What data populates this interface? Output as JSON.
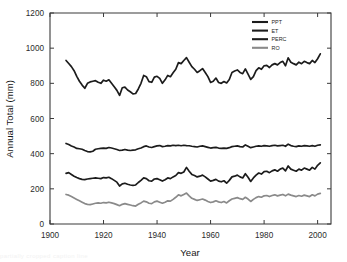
{
  "chart_data": {
    "type": "line",
    "title": "",
    "xlabel": "Year",
    "ylabel": "Annual Total (mm)",
    "xlim": [
      1900,
      2005
    ],
    "ylim": [
      0,
      1200
    ],
    "xticks": [
      1900,
      1920,
      1940,
      1960,
      1980,
      2000
    ],
    "xtick_labels": [
      "1900",
      "1920",
      "1940",
      "1960",
      "1980",
      "2000"
    ],
    "yticks": [
      0,
      200,
      400,
      600,
      800,
      1000,
      1200
    ],
    "ytick_labels": [
      "0",
      "200",
      "400",
      "600",
      "800",
      "1000",
      "1200"
    ],
    "grid": false,
    "legend_position": "top-right-inside",
    "x": [
      1906,
      1907,
      1908,
      1909,
      1910,
      1911,
      1912,
      1913,
      1914,
      1915,
      1916,
      1917,
      1918,
      1919,
      1920,
      1921,
      1922,
      1923,
      1924,
      1925,
      1926,
      1927,
      1928,
      1929,
      1930,
      1931,
      1932,
      1933,
      1934,
      1935,
      1936,
      1937,
      1938,
      1939,
      1940,
      1941,
      1942,
      1943,
      1944,
      1945,
      1946,
      1947,
      1948,
      1949,
      1950,
      1951,
      1952,
      1953,
      1954,
      1955,
      1956,
      1957,
      1958,
      1959,
      1960,
      1961,
      1962,
      1963,
      1964,
      1965,
      1966,
      1967,
      1968,
      1969,
      1970,
      1971,
      1972,
      1973,
      1974,
      1975,
      1976,
      1977,
      1978,
      1979,
      1980,
      1981,
      1982,
      1983,
      1984,
      1985,
      1986,
      1987,
      1988,
      1989,
      1990,
      1991,
      1992,
      1993,
      1994,
      1995,
      1996,
      1997,
      1998,
      1999,
      2000,
      2001
    ],
    "series": [
      {
        "name": "PPT",
        "color": "#1c1c1c",
        "width": 1.7,
        "values": [
          930,
          913,
          895,
          872,
          840,
          812,
          790,
          772,
          800,
          808,
          812,
          815,
          806,
          800,
          818,
          812,
          820,
          800,
          780,
          760,
          731,
          775,
          778,
          762,
          752,
          740,
          742,
          768,
          800,
          845,
          838,
          810,
          806,
          835,
          840,
          828,
          800,
          820,
          845,
          838,
          860,
          880,
          918,
          912,
          930,
          946,
          920,
          895,
          880,
          862,
          872,
          884,
          862,
          838,
          805,
          812,
          830,
          805,
          800,
          810,
          802,
          822,
          862,
          870,
          876,
          862,
          855,
          882,
          852,
          822,
          838,
          872,
          888,
          880,
          900,
          902,
          890,
          905,
          912,
          905,
          918,
          925,
          900,
          945,
          920,
          912,
          905,
          920,
          912,
          925,
          918,
          912,
          930,
          918,
          940,
          968
        ]
      },
      {
        "name": "ET",
        "color": "#1c1c1c",
        "width": 1.7,
        "values": [
          458,
          452,
          444,
          438,
          430,
          428,
          425,
          418,
          412,
          410,
          414,
          425,
          428,
          430,
          432,
          430,
          435,
          432,
          428,
          424,
          418,
          420,
          424,
          420,
          418,
          420,
          422,
          428,
          432,
          440,
          444,
          438,
          435,
          440,
          444,
          446,
          440,
          442,
          446,
          444,
          448,
          446,
          448,
          445,
          448,
          446,
          445,
          442,
          440,
          438,
          442,
          444,
          440,
          436,
          432,
          434,
          436,
          432,
          430,
          432,
          430,
          434,
          440,
          442,
          444,
          440,
          438,
          450,
          442,
          434,
          438,
          442,
          444,
          442,
          446,
          444,
          442,
          446,
          448,
          444,
          446,
          448,
          442,
          454,
          446,
          442,
          440,
          444,
          442,
          446,
          444,
          442,
          446,
          442,
          448,
          450
        ]
      },
      {
        "name": "PERC",
        "color": "#1c1c1c",
        "width": 1.7,
        "values": [
          288,
          292,
          282,
          272,
          264,
          258,
          254,
          252,
          256,
          258,
          260,
          262,
          260,
          258,
          264,
          262,
          266,
          258,
          248,
          238,
          216,
          228,
          232,
          226,
          222,
          220,
          222,
          236,
          248,
          262,
          258,
          246,
          244,
          256,
          258,
          252,
          244,
          252,
          262,
          258,
          268,
          276,
          292,
          288,
          296,
          322,
          300,
          282,
          276,
          268,
          272,
          278,
          268,
          256,
          244,
          248,
          254,
          244,
          240,
          246,
          232,
          248,
          268,
          272,
          278,
          268,
          262,
          286,
          266,
          242,
          262,
          278,
          290,
          284,
          298,
          300,
          292,
          302,
          308,
          300,
          312,
          318,
          302,
          330,
          312,
          306,
          300,
          312,
          306,
          318,
          312,
          306,
          322,
          312,
          334,
          348
        ]
      },
      {
        "name": "RO",
        "color": "#8a8a8a",
        "width": 1.7,
        "values": [
          168,
          164,
          156,
          148,
          140,
          132,
          124,
          116,
          112,
          110,
          114,
          118,
          120,
          118,
          122,
          120,
          124,
          120,
          116,
          110,
          104,
          112,
          116,
          112,
          108,
          104,
          102,
          112,
          120,
          130,
          126,
          118,
          116,
          126,
          130,
          124,
          118,
          124,
          132,
          130,
          140,
          152,
          166,
          160,
          168,
          176,
          160,
          146,
          140,
          134,
          138,
          142,
          136,
          128,
          122,
          126,
          132,
          126,
          122,
          128,
          120,
          132,
          142,
          146,
          150,
          144,
          140,
          152,
          142,
          128,
          140,
          150,
          156,
          152,
          160,
          162,
          156,
          162,
          166,
          160,
          164,
          168,
          160,
          170,
          164,
          160,
          156,
          162,
          158,
          164,
          160,
          156,
          166,
          160,
          170,
          174
        ]
      }
    ]
  },
  "legend": {
    "entries": [
      {
        "label": "PPT"
      },
      {
        "label": "ET"
      },
      {
        "label": "PERC"
      },
      {
        "label": "RO"
      }
    ]
  },
  "caption": {
    "ghost_text": "partially cropped caption line"
  }
}
